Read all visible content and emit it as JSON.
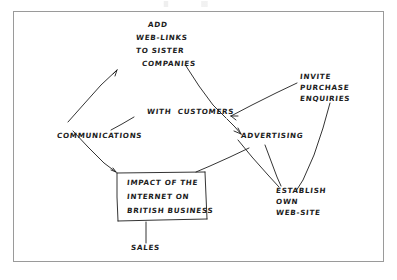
{
  "document": {
    "kind": "hand-drawn-mind-map",
    "title_note": "Hand-drawn brainstorming spider diagram on white paper",
    "ink_color": "#1d1d1d",
    "paper_color": "#ffffff",
    "frame_color": "#9a9a9a"
  },
  "diagram": {
    "central_topic": {
      "id": "central-topic",
      "lines": [
        "IMPACT OF THE",
        "INTERNET ON",
        "BRITISH BUSINESS"
      ],
      "full_text": "IMPACT OF THE INTERNET ON BRITISH BUSINESS",
      "boxed": true
    },
    "nodes": [
      {
        "id": "add-web-links",
        "lines": [
          "ADD",
          "WEB-LINKS",
          "TO SISTER",
          "COMPANIES"
        ],
        "full_text": "ADD WEB-LINKS TO SISTER COMPANIES"
      },
      {
        "id": "invite-purchase-enquiries",
        "lines": [
          "INVITE",
          "PURCHASE",
          "ENQUIRIES"
        ],
        "full_text": "INVITE PURCHASE ENQUIRIES"
      },
      {
        "id": "with-customers",
        "lines": [
          "WITH  CUSTOMERS"
        ],
        "full_text": "WITH CUSTOMERS"
      },
      {
        "id": "communications",
        "lines": [
          "COMMUNICATIONS"
        ],
        "full_text": "COMMUNICATIONS"
      },
      {
        "id": "advertising",
        "lines": [
          "ADVERTISING"
        ],
        "full_text": "ADVERTISING"
      },
      {
        "id": "establish-own-web-site",
        "lines": [
          "ESTABLISH",
          "OWN",
          "WEB-SITE"
        ],
        "full_text": "ESTABLISH OWN WEB-SITE"
      },
      {
        "id": "sales",
        "lines": [
          "SALES"
        ],
        "full_text": "SALES"
      }
    ],
    "connections": [
      {
        "from": "communications",
        "to": "add-web-links"
      },
      {
        "from": "communications",
        "to": "with-customers"
      },
      {
        "from": "communications",
        "to": "central-topic"
      },
      {
        "from": "add-web-links",
        "to": "advertising"
      },
      {
        "from": "advertising",
        "to": "invite-purchase-enquiries"
      },
      {
        "from": "advertising",
        "to": "central-topic"
      },
      {
        "from": "advertising",
        "to": "establish-own-web-site"
      },
      {
        "from": "invite-purchase-enquiries",
        "to": "establish-own-web-site"
      },
      {
        "from": "central-topic",
        "to": "sales"
      }
    ]
  }
}
